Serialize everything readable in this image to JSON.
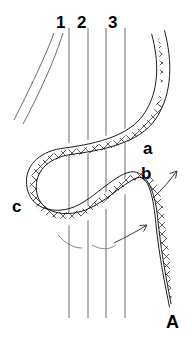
{
  "figure": {
    "panel_label": "A",
    "background_color": "#ffffff",
    "ink_color": "#000000",
    "line_color": "#555555",
    "width": 192,
    "height": 344,
    "caption_labels": {
      "tendon_1": "1",
      "tendon_2": "2",
      "tendon_3": "3",
      "band_point_a": "a",
      "band_point_b": "b",
      "band_point_c": "c"
    },
    "numbered_markers": [
      {
        "label": "1",
        "x": 58,
        "y": 16
      },
      {
        "label": "2",
        "x": 79,
        "y": 16
      },
      {
        "label": "3",
        "x": 110,
        "y": 16
      }
    ],
    "letter_markers": [
      {
        "label": "a",
        "x": 145,
        "y": 147
      },
      {
        "label": "b",
        "x": 143,
        "y": 170
      },
      {
        "label": "c",
        "x": 14,
        "y": 205
      }
    ],
    "panel_marker": {
      "label": "A",
      "x": 168,
      "y": 318
    },
    "vertical_lines": [
      {
        "name": "tendon-line-1",
        "x1": 69,
        "y1": 28,
        "x2": 69,
        "y2": 318
      },
      {
        "name": "tendon-line-2",
        "x1": 88,
        "y1": 28,
        "x2": 88,
        "y2": 318
      },
      {
        "name": "tendon-line-3",
        "x1": 106,
        "y1": 28,
        "x2": 106,
        "y2": 318
      },
      {
        "name": "tendon-line-4",
        "x1": 125,
        "y1": 28,
        "x2": 125,
        "y2": 318
      }
    ],
    "curved_lines": [
      {
        "name": "oblique-tendon-edge-1",
        "path": "M 54 33 C 44 60 28 92 14 120"
      },
      {
        "name": "oblique-tendon-edge-2",
        "path": "M 63 33 C 54 62 38 96 23 124"
      }
    ],
    "band": {
      "name": "woven-graft-band",
      "hatch_pattern": "crosshatch-diamond",
      "centerline": "M 158 32 C 166 62 166 92 150 116 C 134 140 96 146 66 150 C 42 154 28 170 30 190 C 32 212 52 222 74 218 C 98 214 118 186 136 180 C 150 176 156 196 158 220 C 162 254 168 286 172 306",
      "width_px": 13
    },
    "arrows": [
      {
        "name": "rotation-arrow-upper",
        "path": "M 154 196 L 176 172",
        "head": "M 176 172 L 170 174 M 176 172 L 174 179"
      },
      {
        "name": "rotation-arrow-lower",
        "path": "M 117 242 L 146 226",
        "head": "M 146 226 L 139 226 M 146 226 L 143 232"
      }
    ],
    "hidden_markers": [
      {
        "name": "occlusion-arc-left",
        "path": "M 58 235 C 66 244 74 248 82 248"
      },
      {
        "name": "occlusion-arc-mid",
        "path": "M 92 245 C 100 250 108 250 116 246"
      }
    ]
  }
}
